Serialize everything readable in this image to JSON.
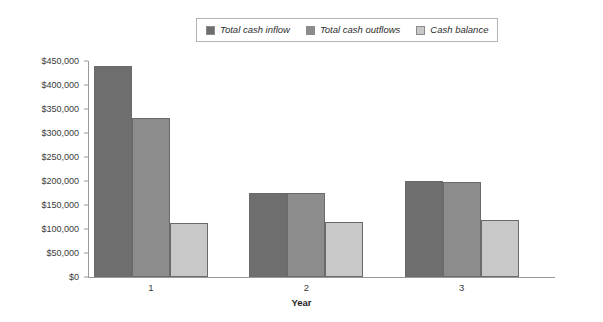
{
  "chart_data": {
    "type": "bar",
    "title": "",
    "xlabel": "Year",
    "ylabel": "",
    "categories": [
      "1",
      "2",
      "3"
    ],
    "series": [
      {
        "name": "Total cash inflow",
        "color": "#6e6e6e",
        "values": [
          440000,
          175000,
          200000
        ]
      },
      {
        "name": "Total cash outflows",
        "color": "#8c8c8c",
        "values": [
          332000,
          174000,
          197000
        ]
      },
      {
        "name": "Cash balance",
        "color": "#c8c8c8",
        "values": [
          113000,
          115000,
          118000
        ]
      }
    ],
    "ylim": [
      0,
      450000
    ],
    "yticks": [
      0,
      50000,
      100000,
      150000,
      200000,
      250000,
      300000,
      350000,
      400000,
      450000
    ],
    "ytick_labels": [
      "$0",
      "$50,000",
      "$100,000",
      "$150,000",
      "$200,000",
      "$250,000",
      "$300,000",
      "$350,000",
      "$400,000",
      "$450,000"
    ],
    "grid": false,
    "legend_position": "top-center"
  },
  "legend": {
    "items": [
      {
        "label": "Total cash inflow",
        "color": "#6e6e6e"
      },
      {
        "label": "Total cash outflows",
        "color": "#8c8c8c"
      },
      {
        "label": "Cash balance",
        "color": "#c8c8c8"
      }
    ]
  },
  "axes": {
    "x_title": "Year",
    "x_labels": [
      "1",
      "2",
      "3"
    ],
    "y_labels": [
      "$450,000",
      "$400,000",
      "$350,000",
      "$300,000",
      "$250,000",
      "$200,000",
      "$150,000",
      "$100,000",
      "$50,000",
      "$0"
    ]
  },
  "colors": {
    "axis": "#9a9a9a",
    "text": "#3a3a3a",
    "legend_border": "#b4b4b4",
    "bar_border": "#6a6a6a",
    "background": "#ffffff"
  }
}
